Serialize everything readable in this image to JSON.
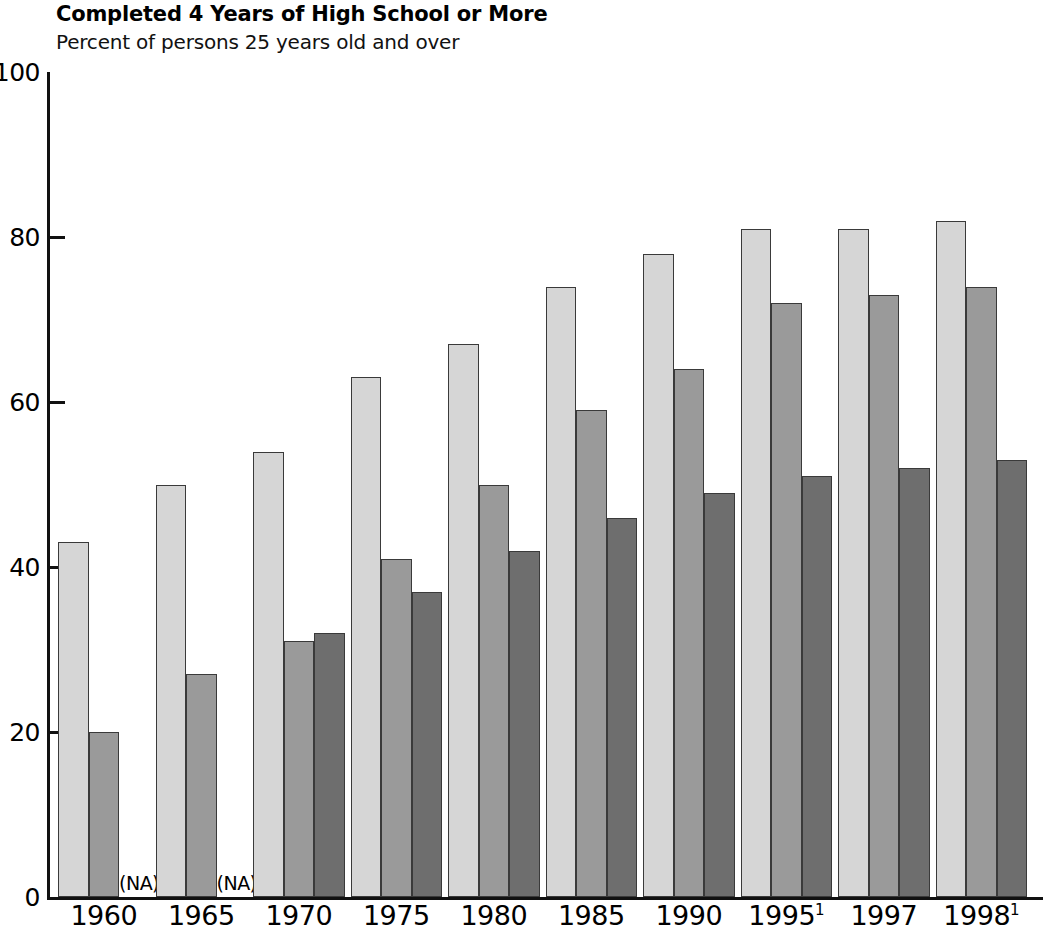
{
  "header": {
    "title": "Completed 4 Years of High School or More",
    "subtitle": "Percent of persons 25 years old and over"
  },
  "na_label": "(NA)",
  "chart_data": {
    "type": "bar",
    "title": "Completed 4 Years of High School or More",
    "subtitle": "Percent of persons 25 years old and over",
    "xlabel": "",
    "ylabel": "Percent of persons 25 years old and over",
    "ylim": [
      0,
      100
    ],
    "ytick_labels": [
      "0",
      "20",
      "40",
      "60",
      "80",
      "100"
    ],
    "ytick_values": [
      0,
      20,
      40,
      60,
      80,
      100
    ],
    "grid": false,
    "legend": "none",
    "categories": [
      "1960",
      "1965",
      "1970",
      "1975",
      "1980",
      "1985",
      "1990",
      "1995",
      "1997",
      "1998"
    ],
    "category_labels": [
      "1960",
      "1965",
      "1970",
      "1975",
      "1980",
      "1985",
      "1990",
      "1995¹",
      "1997",
      "1998¹"
    ],
    "category_footnotes": [
      "",
      "",
      "",
      "",
      "",
      "",
      "",
      "1",
      "",
      "1"
    ],
    "series": [
      {
        "name": "series-1-light",
        "color": "#d6d6d6",
        "values": [
          43,
          50,
          54,
          63,
          67,
          74,
          78,
          81,
          81,
          82
        ]
      },
      {
        "name": "series-2-medium",
        "color": "#9a9a9a",
        "values": [
          20,
          27,
          31,
          41,
          50,
          59,
          64,
          72,
          73,
          74
        ]
      },
      {
        "name": "series-3-dark",
        "color": "#6e6e6e",
        "values": [
          null,
          null,
          32,
          37,
          42,
          46,
          49,
          51,
          52,
          53
        ]
      }
    ],
    "missing_marker": "(NA)"
  }
}
